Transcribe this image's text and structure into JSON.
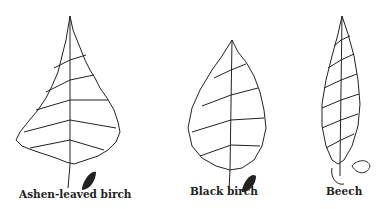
{
  "figures": [
    {
      "label": "Ashen-leaved birch"
    },
    {
      "label": "Black birch"
    },
    {
      "label": "Beech"
    }
  ]
}
